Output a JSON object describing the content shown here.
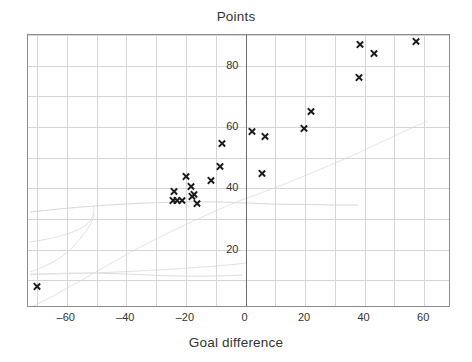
{
  "chart_data": {
    "type": "scatter",
    "title": "Points",
    "xlabel": "Goal difference",
    "ylabel": "Points",
    "xlim": [
      -73,
      69
    ],
    "ylim": [
      1,
      90
    ],
    "xticks": [
      -60,
      -40,
      -20,
      0,
      20,
      40,
      60
    ],
    "xtick_labels": [
      "–60",
      "–40",
      "–20",
      "0",
      "20",
      "40",
      "60"
    ],
    "yticks": [
      20,
      40,
      60,
      80
    ],
    "ytick_labels": [
      "20",
      "40",
      "60",
      "80"
    ],
    "grid": true,
    "grid_color": "#d6d6d6",
    "marker": "x",
    "marker_color": "#1c1c1c",
    "legend": null,
    "points": [
      {
        "x": -70,
        "y": 8
      },
      {
        "x": -24.5,
        "y": 36
      },
      {
        "x": -23,
        "y": 36
      },
      {
        "x": -24,
        "y": 39
      },
      {
        "x": -21.5,
        "y": 36
      },
      {
        "x": -20,
        "y": 44
      },
      {
        "x": -18.5,
        "y": 40.5
      },
      {
        "x": -18,
        "y": 37.5
      },
      {
        "x": -17.5,
        "y": 38
      },
      {
        "x": -16.5,
        "y": 35
      },
      {
        "x": -11.5,
        "y": 42.5
      },
      {
        "x": -8.5,
        "y": 47
      },
      {
        "x": -8,
        "y": 54.5
      },
      {
        "x": 2,
        "y": 58.5
      },
      {
        "x": 5.5,
        "y": 45
      },
      {
        "x": 6.5,
        "y": 57
      },
      {
        "x": 19.5,
        "y": 59.5
      },
      {
        "x": 22,
        "y": 65
      },
      {
        "x": 38.5,
        "y": 87
      },
      {
        "x": 38,
        "y": 76
      },
      {
        "x": 43,
        "y": 84
      },
      {
        "x": 57,
        "y": 88
      }
    ]
  },
  "axis": {
    "title": "Points",
    "xlabel": "Goal difference"
  }
}
